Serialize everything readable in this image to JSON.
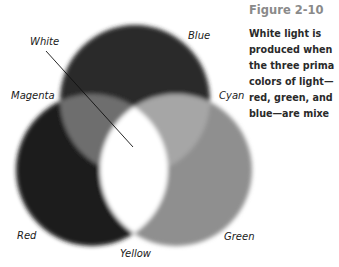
{
  "figure": {
    "title": "Figure 2-10",
    "caption_lines": [
      "White light is",
      "produced when",
      "the three prima",
      "colors of light—",
      "red, green, and",
      "blue—are mixe"
    ]
  },
  "labels": {
    "white": "White",
    "blue": "Blue",
    "magenta": "Magenta",
    "cyan": "Cyan",
    "red": "Red",
    "green": "Green",
    "yellow": "Yellow"
  },
  "colors": {
    "blue_circle": "#2b2b2b",
    "red_circle": "#1e1e1e",
    "green_circle": "#8f8f8f",
    "magenta_overlap": "#6e6e6e",
    "cyan_overlap": "#a6a6a6",
    "yellow_overlap": "#ffffff",
    "white_center": "#ffffff"
  }
}
